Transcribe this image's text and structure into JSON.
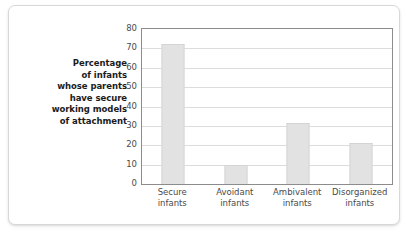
{
  "chart_data": {
    "type": "bar",
    "title": "",
    "subtitle": "",
    "xlabel": "",
    "ylabel": "Percentage of infants whose parents have secure working models of attachment",
    "ylabel_lines": [
      "Percentage",
      "of infants",
      "whose parents",
      "have secure",
      "working models",
      "of attachment"
    ],
    "categories": [
      "Secure infants",
      "Avoidant infants",
      "Ambivalent infants",
      "Disorganized infants"
    ],
    "category_lines": [
      [
        "Secure",
        "infants"
      ],
      [
        "Avoidant",
        "infants"
      ],
      [
        "Ambivalent",
        "infants"
      ],
      [
        "Disorganized",
        "infants"
      ]
    ],
    "values": [
      72.5,
      9.7,
      31.5,
      21
    ],
    "ylim": [
      0,
      80
    ],
    "ytick_values": [
      0,
      10,
      20,
      30,
      40,
      50,
      60,
      70,
      80
    ],
    "ytick_labels": [
      "0",
      "10",
      "20",
      "30",
      "40",
      "50",
      "60",
      "70",
      "80"
    ],
    "grid": true,
    "legend": null,
    "colors": {
      "bar_fill": "#e2e2e2",
      "bar_edge": "#d4d4d4",
      "gridline": "#dcdcdc",
      "axis_frame": "#8c8c8c",
      "tick_text": "#4a4a4a",
      "label_text": "#1b1b1b",
      "figure_background": "#ffffff",
      "figure_border": "#d8d8d8"
    }
  }
}
